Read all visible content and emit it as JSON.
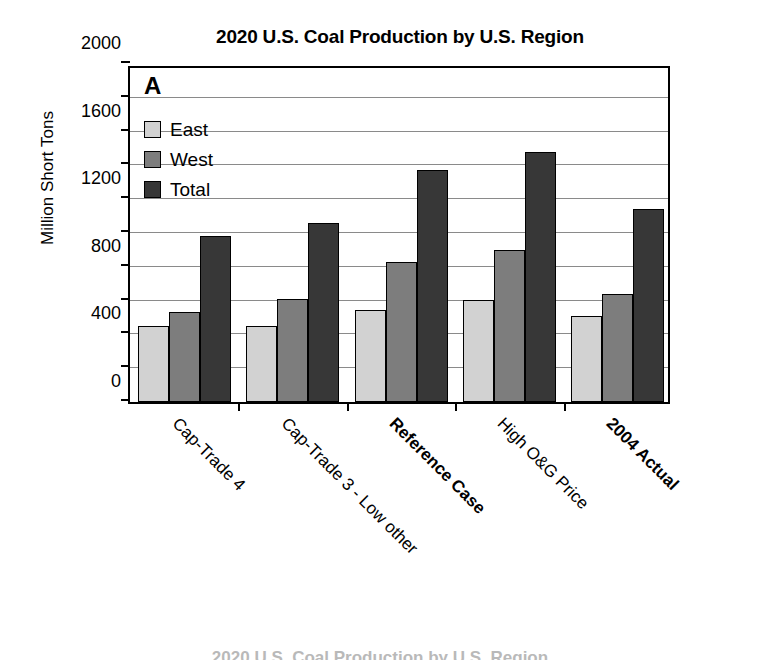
{
  "chart_data": {
    "type": "bar",
    "title": "2020 U.S. Coal Production by U.S. Region",
    "panel_label": "A",
    "xlabel": "",
    "ylabel": "Million Short Tons",
    "ylim": [
      0,
      2000
    ],
    "y_major_ticks": [
      0,
      400,
      800,
      1200,
      1600,
      2000
    ],
    "y_minor_ticks": [
      200,
      600,
      1000,
      1400,
      1800
    ],
    "grid": true,
    "legend_position": "top-left inside plot",
    "categories": [
      "Cap-Trade 4",
      "Cap-Trade 3 - Low other",
      "Reference Case",
      "High O&G Price",
      "2004 Actual"
    ],
    "categories_bold": [
      false,
      false,
      true,
      false,
      true
    ],
    "series": [
      {
        "name": "East",
        "color": "#d2d2d2",
        "values": [
          450,
          450,
          545,
          605,
          510
        ]
      },
      {
        "name": "West",
        "color": "#7d7d7d",
        "values": [
          530,
          610,
          830,
          900,
          640
        ]
      },
      {
        "name": "Total",
        "color": "#373737",
        "values": [
          980,
          1060,
          1370,
          1480,
          1140
        ]
      }
    ]
  },
  "legend": {
    "items": [
      {
        "label": "East"
      },
      {
        "label": "West"
      },
      {
        "label": "Total"
      }
    ]
  },
  "bottom_caption": "2020 U.S. Coal Production by U.S. Region"
}
